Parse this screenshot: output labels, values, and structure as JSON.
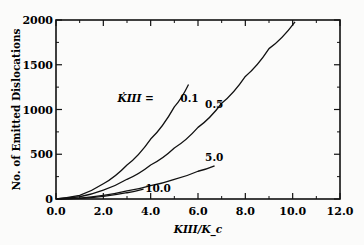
{
  "chart_data": {
    "type": "line",
    "title": "",
    "xlabel": "K_III/K_c",
    "ylabel": "No. of Emitted Dislocations",
    "xlim": [
      0,
      12
    ],
    "ylim": [
      0,
      2000
    ],
    "xticks": [
      "0.0",
      "2.0",
      "4.0",
      "6.0",
      "8.0",
      "10.0",
      "12.0"
    ],
    "yticks": [
      "0",
      "500",
      "1000",
      "1500",
      "2000"
    ],
    "grid": false,
    "legend_position": "inline labels",
    "parameter_label": "K̇_III =",
    "series": [
      {
        "name": "0.1",
        "x": [
          0,
          1,
          2,
          3,
          4,
          5,
          5.6
        ],
        "y": [
          0,
          40,
          170,
          380,
          670,
          1030,
          1280
        ]
      },
      {
        "name": "0.5",
        "x": [
          0,
          1,
          2,
          3,
          4,
          5,
          6,
          7,
          8,
          9,
          10.1
        ],
        "y": [
          0,
          25,
          100,
          220,
          380,
          570,
          800,
          1070,
          1370,
          1680,
          1980
        ]
      },
      {
        "name": "5.0",
        "x": [
          0,
          1,
          2,
          3,
          4,
          5,
          6,
          6.7
        ],
        "y": [
          0,
          10,
          40,
          90,
          150,
          220,
          310,
          370
        ]
      },
      {
        "name": "10.0",
        "x": [
          0,
          1,
          2,
          3,
          3.7
        ],
        "y": [
          0,
          8,
          30,
          70,
          110
        ]
      }
    ]
  }
}
